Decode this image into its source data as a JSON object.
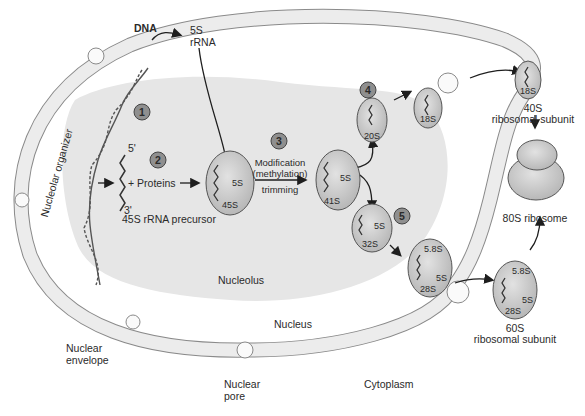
{
  "figure": {
    "colors": {
      "envelope_fill": "#ececec",
      "envelope_stroke": "#8a8a8a",
      "nucleolus_fill": "#e6e6e6",
      "particle_fill": "#c4c4c4",
      "particle_stroke": "#555555",
      "step_badge_fill": "#8f8f8f",
      "text": "#2a2a2a"
    }
  },
  "labels": {
    "dna": "DNA",
    "rrna_5s_line1": "5S",
    "rrna_5s_line2": "rRNA",
    "nucleolar_organizer": "Nucleolar organizer",
    "five_prime": "5'",
    "three_prime": "3'",
    "plus_proteins": "+ Proteins",
    "precursor_45s": "45S rRNA precursor",
    "modification": "Modification",
    "methylation": "(methylation)",
    "trimming": "trimming",
    "nucleolus": "Nucleolus",
    "nucleus": "Nucleus",
    "nuclear_envelope_line1": "Nuclear",
    "nuclear_envelope_line2": "envelope",
    "nuclear_pore_line1": "Nuclear",
    "nuclear_pore_line2": "pore",
    "cytoplasm": "Cytoplasm",
    "subunit_40s_line1": "40S",
    "subunit_40s_line2": "ribosomal subunit",
    "ribosome_80s": "80S ribosome",
    "subunit_60s_line1": "60S",
    "subunit_60s_line2": "ribosomal subunit"
  },
  "steps": [
    "1",
    "2",
    "3",
    "4",
    "5"
  ],
  "particles": {
    "p45s": {
      "main": "45S",
      "inner": "5S"
    },
    "p41s": {
      "main": "41S",
      "inner": "5S"
    },
    "p20s": {
      "main": "20S"
    },
    "p18s_nuc": {
      "main": "18S"
    },
    "p18s_cyto": {
      "main": "18S"
    },
    "p32s": {
      "main": "32S",
      "inner": "5S"
    },
    "p28s_nuc": {
      "main": "28S",
      "a": "5.8S",
      "b": "5S"
    },
    "p28s_cyto": {
      "main": "28S",
      "a": "5.8S",
      "b": "5S"
    }
  }
}
